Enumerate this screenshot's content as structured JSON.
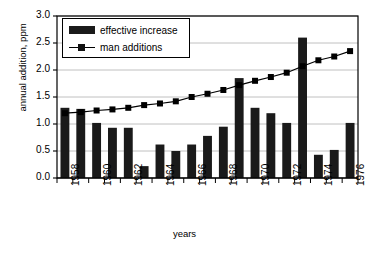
{
  "chart_data": {
    "type": "bar",
    "title": "",
    "xlabel": "years",
    "ylabel": "annual addition, ppm",
    "categories": [
      "1958",
      "1959",
      "1960",
      "1961",
      "1962",
      "1963",
      "1964",
      "1965",
      "1966",
      "1967",
      "1968",
      "1969",
      "1970",
      "1971",
      "1972",
      "1973",
      "1974",
      "1975",
      "1976"
    ],
    "x_tick_labels": [
      "1958",
      "1960",
      "1962",
      "1964",
      "1966",
      "1968",
      "1970",
      "1972",
      "1974",
      "1976"
    ],
    "y_tick_labels": [
      "0.0",
      "0.5",
      "1.0",
      "1.5",
      "2.0",
      "2.5",
      "3.0"
    ],
    "ylim": [
      0,
      3.0
    ],
    "y_tick_step": 0.5,
    "grid": "horizontal",
    "legend_position": "top-left-inside",
    "series": [
      {
        "name": "effective increase",
        "render": "bar",
        "color": "#1a1a1a",
        "values": [
          1.3,
          1.28,
          1.02,
          0.93,
          0.93,
          0.22,
          0.62,
          0.5,
          0.62,
          0.78,
          0.95,
          1.85,
          1.3,
          1.2,
          1.02,
          2.6,
          0.43,
          0.52,
          1.02
        ]
      },
      {
        "name": "man additions",
        "render": "line-marker",
        "color": "#000000",
        "values": [
          1.2,
          1.22,
          1.25,
          1.27,
          1.3,
          1.35,
          1.38,
          1.42,
          1.5,
          1.56,
          1.63,
          1.72,
          1.8,
          1.87,
          1.95,
          2.07,
          2.18,
          2.25,
          2.35
        ]
      }
    ]
  },
  "legend": {
    "items": [
      {
        "label": "effective increase",
        "marker": "bar-swatch"
      },
      {
        "label": "man additions",
        "marker": "line-square-marker"
      }
    ]
  }
}
